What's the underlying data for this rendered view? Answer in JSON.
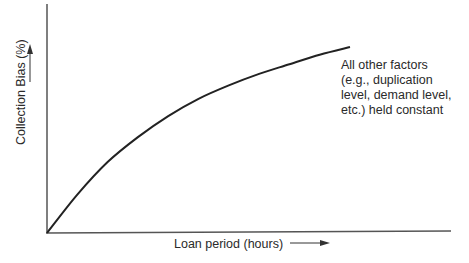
{
  "chart_data": {
    "type": "line",
    "title": "",
    "xlabel": "Loan period (hours)",
    "ylabel": "Collection Bias (%)",
    "x_ticks": [],
    "y_ticks": [],
    "grid": false,
    "legend": null,
    "series": [
      {
        "name": "Collection bias vs. loan period",
        "shape": "concave increasing curve starting at origin, flattening toward the right",
        "x": [
          0,
          0.1,
          0.2,
          0.3,
          0.4,
          0.5,
          0.6,
          0.7,
          0.8,
          0.9,
          1.0
        ],
        "y": [
          0,
          0.2,
          0.37,
          0.5,
          0.61,
          0.7,
          0.77,
          0.83,
          0.88,
          0.93,
          0.97
        ]
      }
    ],
    "annotations": [
      "All other factors (e.g., duplication level, demand level, etc.) held constant"
    ],
    "axis_units": "qualitative (no numeric scale shown)"
  },
  "labels": {
    "ylabel": "Collection Bias (%) ——▶",
    "xlabel": "Loan period (hours) ——▶",
    "note_lines": [
      "All other factors",
      "(e.g., duplication",
      "level, demand level,",
      "etc.) held constant"
    ]
  },
  "colors": {
    "axis": "#555555",
    "curve": "#222222",
    "text": "#2a2a2a"
  }
}
